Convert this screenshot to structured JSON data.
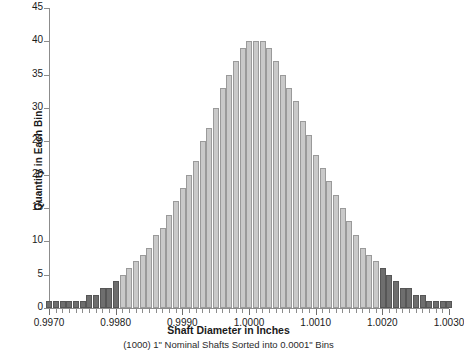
{
  "chart_data": {
    "type": "bar",
    "title": "",
    "subtitle": "(1000) 1\" Nominal Shafts Sorted into 0.0001\" Bins",
    "xlabel": "Shaft Diameter in Inches",
    "ylabel": "Quantity in Each Bin",
    "grid": false,
    "legend_position": "none",
    "xlim": [
      0.997,
      1.003
    ],
    "ylim": [
      0,
      45
    ],
    "bin_width": 0.0001,
    "total_count": 1000,
    "xtick_labels": [
      "0.9970",
      "0.9980",
      "0.9990",
      "1.0000",
      "1.0010",
      "1.0020",
      "1.0030"
    ],
    "xtick_values": [
      0.997,
      0.998,
      0.999,
      1.0,
      1.001,
      1.002,
      1.003
    ],
    "ytick_labels": [
      "0",
      "5",
      "10",
      "15",
      "20",
      "25",
      "30",
      "35",
      "40",
      "45"
    ],
    "ytick_values": [
      0,
      5,
      10,
      15,
      20,
      25,
      30,
      35,
      40,
      45
    ],
    "series_colors": {
      "inside_tolerance": "#c9c9c9",
      "outside_tolerance": "#6e6e6e",
      "axis": "#8c8c8c"
    },
    "categories": [
      "0.9970",
      "0.9971",
      "0.9972",
      "0.9973",
      "0.9974",
      "0.9975",
      "0.9976",
      "0.9977",
      "0.9978",
      "0.9979",
      "0.9980",
      "0.9981",
      "0.9982",
      "0.9983",
      "0.9984",
      "0.9985",
      "0.9986",
      "0.9987",
      "0.9988",
      "0.9989",
      "0.9990",
      "0.9991",
      "0.9992",
      "0.9993",
      "0.9994",
      "0.9995",
      "0.9996",
      "0.9997",
      "0.9998",
      "0.9999",
      "1.0000",
      "1.0001",
      "1.0002",
      "1.0003",
      "1.0004",
      "1.0005",
      "1.0006",
      "1.0007",
      "1.0008",
      "1.0009",
      "1.0010",
      "1.0011",
      "1.0012",
      "1.0013",
      "1.0014",
      "1.0015",
      "1.0016",
      "1.0017",
      "1.0018",
      "1.0019",
      "1.0020",
      "1.0021",
      "1.0022",
      "1.0023",
      "1.0024",
      "1.0025",
      "1.0026",
      "1.0027",
      "1.0028",
      "1.0029",
      "1.0030"
    ],
    "values": [
      1,
      1,
      1,
      1,
      1,
      1,
      2,
      2,
      3,
      3,
      4,
      5,
      6,
      7,
      8,
      9,
      11,
      12,
      14,
      16,
      18,
      20,
      22,
      25,
      27,
      30,
      33,
      35,
      37,
      39,
      40,
      40,
      40,
      39,
      37,
      35,
      33,
      31,
      28,
      26,
      23,
      21,
      19,
      17,
      15,
      13,
      11,
      9,
      8,
      7,
      6,
      5,
      4,
      3,
      3,
      2,
      2,
      1,
      1,
      1,
      1
    ],
    "bar_tolerance": [
      "outside",
      "outside",
      "outside",
      "outside",
      "outside",
      "outside",
      "outside",
      "outside",
      "outside",
      "outside",
      "outside",
      "inside",
      "inside",
      "inside",
      "inside",
      "inside",
      "inside",
      "inside",
      "inside",
      "inside",
      "inside",
      "inside",
      "inside",
      "inside",
      "inside",
      "inside",
      "inside",
      "inside",
      "inside",
      "inside",
      "inside",
      "inside",
      "inside",
      "inside",
      "inside",
      "inside",
      "inside",
      "inside",
      "inside",
      "inside",
      "inside",
      "inside",
      "inside",
      "inside",
      "inside",
      "inside",
      "inside",
      "inside",
      "inside",
      "inside",
      "outside",
      "outside",
      "outside",
      "outside",
      "outside",
      "outside",
      "outside",
      "outside",
      "outside",
      "outside",
      "outside"
    ]
  }
}
